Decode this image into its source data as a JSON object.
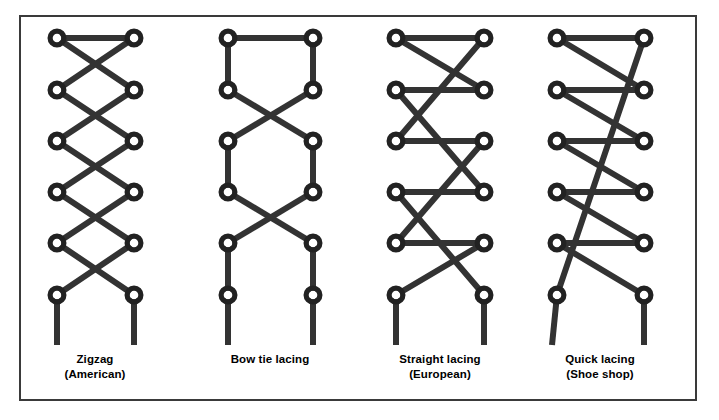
{
  "figure": {
    "background_color": "#ffffff",
    "frame_color": "#3a3a3a",
    "lace_color": "#333333",
    "eyelet_color": "#222222"
  },
  "diagrams": [
    {
      "id": "zigzag-american",
      "name": "Zigzag (American)",
      "caption_line1": "Zigzag",
      "caption_line2": "(American)",
      "caption_center_x": 95,
      "caption_top_y": 352,
      "left_x": 57,
      "right_x": 134,
      "rows_y": [
        38,
        90,
        141,
        192,
        243,
        295
      ],
      "eyelet_rows": 6,
      "tail_bottom_y": 345,
      "segments": [
        {
          "type": "horizontal",
          "from": [
            57,
            38
          ],
          "to": [
            134,
            38
          ]
        },
        {
          "type": "diagonal",
          "from": [
            57,
            38
          ],
          "to": [
            134,
            90
          ]
        },
        {
          "type": "diagonal",
          "from": [
            134,
            38
          ],
          "to": [
            57,
            90
          ]
        },
        {
          "type": "diagonal",
          "from": [
            57,
            90
          ],
          "to": [
            134,
            141
          ]
        },
        {
          "type": "diagonal",
          "from": [
            134,
            90
          ],
          "to": [
            57,
            141
          ]
        },
        {
          "type": "diagonal",
          "from": [
            57,
            141
          ],
          "to": [
            134,
            192
          ]
        },
        {
          "type": "diagonal",
          "from": [
            134,
            141
          ],
          "to": [
            57,
            192
          ]
        },
        {
          "type": "diagonal",
          "from": [
            57,
            192
          ],
          "to": [
            134,
            243
          ]
        },
        {
          "type": "diagonal",
          "from": [
            134,
            192
          ],
          "to": [
            57,
            243
          ]
        },
        {
          "type": "diagonal",
          "from": [
            57,
            243
          ],
          "to": [
            134,
            295
          ]
        },
        {
          "type": "diagonal",
          "from": [
            134,
            243
          ],
          "to": [
            57,
            295
          ]
        },
        {
          "type": "tail",
          "from": [
            57,
            295
          ],
          "to": [
            57,
            345
          ]
        },
        {
          "type": "tail",
          "from": [
            134,
            295
          ],
          "to": [
            134,
            345
          ]
        }
      ]
    },
    {
      "id": "bow-tie-lacing",
      "name": "Bow tie lacing",
      "caption_line1": "Bow tie lacing",
      "caption_line2": "",
      "caption_center_x": 270,
      "caption_top_y": 352,
      "left_x": 228,
      "right_x": 313,
      "rows_y": [
        38,
        90,
        141,
        192,
        243,
        295
      ],
      "eyelet_rows": 6,
      "tail_bottom_y": 345,
      "segments": [
        {
          "type": "horizontal",
          "from": [
            228,
            38
          ],
          "to": [
            313,
            38
          ]
        },
        {
          "type": "vertical",
          "from": [
            228,
            38
          ],
          "to": [
            228,
            90
          ]
        },
        {
          "type": "vertical",
          "from": [
            313,
            38
          ],
          "to": [
            313,
            90
          ]
        },
        {
          "type": "diagonal",
          "from": [
            228,
            90
          ],
          "to": [
            313,
            141
          ]
        },
        {
          "type": "diagonal",
          "from": [
            313,
            90
          ],
          "to": [
            228,
            141
          ]
        },
        {
          "type": "vertical",
          "from": [
            228,
            141
          ],
          "to": [
            228,
            192
          ]
        },
        {
          "type": "vertical",
          "from": [
            313,
            141
          ],
          "to": [
            313,
            192
          ]
        },
        {
          "type": "diagonal",
          "from": [
            228,
            192
          ],
          "to": [
            313,
            243
          ]
        },
        {
          "type": "diagonal",
          "from": [
            313,
            192
          ],
          "to": [
            228,
            243
          ]
        },
        {
          "type": "tail",
          "from": [
            228,
            243
          ],
          "to": [
            228,
            345
          ]
        },
        {
          "type": "tail",
          "from": [
            313,
            243
          ],
          "to": [
            313,
            345
          ]
        }
      ]
    },
    {
      "id": "straight-lacing-european",
      "name": "Straight lacing (European)",
      "caption_line1": "Straight lacing",
      "caption_line2": "(European)",
      "caption_center_x": 440,
      "caption_top_y": 352,
      "left_x": 396,
      "right_x": 484,
      "rows_y": [
        38,
        90,
        141,
        192,
        243,
        295
      ],
      "eyelet_rows": 6,
      "tail_bottom_y": 345,
      "segments": [
        {
          "type": "horizontal",
          "from": [
            396,
            38
          ],
          "to": [
            484,
            38
          ]
        },
        {
          "type": "horizontal",
          "from": [
            396,
            90
          ],
          "to": [
            484,
            90
          ]
        },
        {
          "type": "horizontal",
          "from": [
            396,
            141
          ],
          "to": [
            484,
            141
          ]
        },
        {
          "type": "horizontal",
          "from": [
            396,
            192
          ],
          "to": [
            484,
            192
          ]
        },
        {
          "type": "horizontal",
          "from": [
            396,
            243
          ],
          "to": [
            484,
            243
          ]
        },
        {
          "type": "diagonal",
          "from": [
            396,
            38
          ],
          "to": [
            484,
            90
          ]
        },
        {
          "type": "diagonal",
          "from": [
            484,
            38
          ],
          "to": [
            396,
            141
          ]
        },
        {
          "type": "diagonal",
          "from": [
            396,
            90
          ],
          "to": [
            484,
            192
          ]
        },
        {
          "type": "diagonal",
          "from": [
            484,
            141
          ],
          "to": [
            396,
            243
          ]
        },
        {
          "type": "diagonal",
          "from": [
            396,
            192
          ],
          "to": [
            484,
            295
          ]
        },
        {
          "type": "diagonal",
          "from": [
            484,
            243
          ],
          "to": [
            396,
            295
          ]
        },
        {
          "type": "tail",
          "from": [
            396,
            295
          ],
          "to": [
            396,
            345
          ]
        },
        {
          "type": "tail",
          "from": [
            484,
            295
          ],
          "to": [
            484,
            345
          ]
        }
      ]
    },
    {
      "id": "quick-lacing-shoe-shop",
      "name": "Quick lacing (Shoe shop)",
      "caption_line1": "Quick lacing",
      "caption_line2": "(Shoe shop)",
      "caption_center_x": 600,
      "caption_top_y": 352,
      "left_x": 557,
      "right_x": 644,
      "rows_y": [
        38,
        90,
        141,
        192,
        243,
        295
      ],
      "eyelet_rows": 6,
      "tail_bottom_y": 345,
      "segments": [
        {
          "type": "horizontal",
          "from": [
            557,
            38
          ],
          "to": [
            644,
            38
          ]
        },
        {
          "type": "horizontal",
          "from": [
            557,
            90
          ],
          "to": [
            644,
            90
          ]
        },
        {
          "type": "horizontal",
          "from": [
            557,
            141
          ],
          "to": [
            644,
            141
          ]
        },
        {
          "type": "horizontal",
          "from": [
            557,
            192
          ],
          "to": [
            644,
            192
          ]
        },
        {
          "type": "horizontal",
          "from": [
            557,
            243
          ],
          "to": [
            644,
            243
          ]
        },
        {
          "type": "diagonal",
          "from": [
            557,
            38
          ],
          "to": [
            644,
            90
          ]
        },
        {
          "type": "diagonal",
          "from": [
            557,
            90
          ],
          "to": [
            644,
            141
          ]
        },
        {
          "type": "diagonal",
          "from": [
            557,
            141
          ],
          "to": [
            644,
            192
          ]
        },
        {
          "type": "diagonal",
          "from": [
            557,
            192
          ],
          "to": [
            644,
            243
          ]
        },
        {
          "type": "diagonal",
          "from": [
            557,
            243
          ],
          "to": [
            644,
            295
          ]
        },
        {
          "type": "diagonal",
          "from": [
            557,
            295
          ],
          "to": [
            644,
            38
          ]
        },
        {
          "type": "tail",
          "from": [
            557,
            295
          ],
          "to": [
            552,
            345
          ]
        },
        {
          "type": "tail",
          "from": [
            644,
            295
          ],
          "to": [
            644,
            345
          ]
        }
      ]
    }
  ]
}
